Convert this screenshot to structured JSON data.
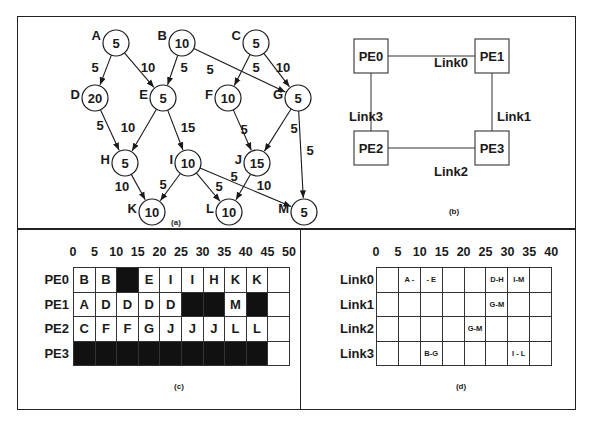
{
  "panels": {
    "a": {
      "caption": "(a)",
      "nodes": [
        {
          "id": "A",
          "weight": "5",
          "x": 116,
          "y": 43
        },
        {
          "id": "B",
          "weight": "10",
          "x": 182,
          "y": 43
        },
        {
          "id": "C",
          "weight": "5",
          "x": 256,
          "y": 43
        },
        {
          "id": "D",
          "weight": "20",
          "x": 95,
          "y": 98
        },
        {
          "id": "E",
          "weight": "5",
          "x": 163,
          "y": 98
        },
        {
          "id": "F",
          "weight": "10",
          "x": 228,
          "y": 98
        },
        {
          "id": "G",
          "weight": "5",
          "x": 298,
          "y": 98
        },
        {
          "id": "H",
          "weight": "5",
          "x": 125,
          "y": 163
        },
        {
          "id": "I",
          "weight": "10",
          "x": 188,
          "y": 163
        },
        {
          "id": "J",
          "weight": "15",
          "x": 257,
          "y": 163
        },
        {
          "id": "K",
          "weight": "10",
          "x": 152,
          "y": 212
        },
        {
          "id": "L",
          "weight": "10",
          "x": 229,
          "y": 212
        },
        {
          "id": "M",
          "weight": "5",
          "x": 304,
          "y": 212
        }
      ],
      "edges": [
        {
          "from": "A",
          "to": "D",
          "weight": "5",
          "lx": 95,
          "ly": 72
        },
        {
          "from": "A",
          "to": "E",
          "weight": "10",
          "lx": 148,
          "ly": 72
        },
        {
          "from": "B",
          "to": "E",
          "weight": "5",
          "lx": 184,
          "ly": 72
        },
        {
          "from": "B",
          "to": "G",
          "weight": "5",
          "lx": 210,
          "ly": 74
        },
        {
          "from": "C",
          "to": "F",
          "weight": "5",
          "lx": 256,
          "ly": 72
        },
        {
          "from": "C",
          "to": "G",
          "weight": "10",
          "lx": 283,
          "ly": 72
        },
        {
          "from": "D",
          "to": "H",
          "weight": "5",
          "lx": 100,
          "ly": 130
        },
        {
          "from": "E",
          "to": "H",
          "weight": "10",
          "lx": 128,
          "ly": 132
        },
        {
          "from": "E",
          "to": "I",
          "weight": "15",
          "lx": 188,
          "ly": 132
        },
        {
          "from": "F",
          "to": "J",
          "weight": "5",
          "lx": 244,
          "ly": 134
        },
        {
          "from": "G",
          "to": "J",
          "weight": "5",
          "lx": 294,
          "ly": 133
        },
        {
          "from": "G",
          "to": "M",
          "weight": "5",
          "lx": 310,
          "ly": 155
        },
        {
          "from": "H",
          "to": "K",
          "weight": "10",
          "lx": 122,
          "ly": 191
        },
        {
          "from": "I",
          "to": "K",
          "weight": "5",
          "lx": 163,
          "ly": 189
        },
        {
          "from": "I",
          "to": "L",
          "weight": "5",
          "lx": 219,
          "ly": 191
        },
        {
          "from": "I",
          "to": "M",
          "weight": "10",
          "lx": 264,
          "ly": 190
        },
        {
          "from": "J",
          "to": "L",
          "weight": "5",
          "lx": 234,
          "ly": 181
        }
      ]
    },
    "b": {
      "caption": "(b)",
      "pes": [
        {
          "id": "PE0",
          "x": 371,
          "y": 56
        },
        {
          "id": "PE1",
          "x": 492,
          "y": 56
        },
        {
          "id": "PE2",
          "x": 371,
          "y": 148
        },
        {
          "id": "PE3",
          "x": 492,
          "y": 148
        }
      ],
      "links": [
        {
          "label": "Link0",
          "lx": 451,
          "ly": 67
        },
        {
          "label": "Link1",
          "lx": 514,
          "ly": 121
        },
        {
          "label": "Link2",
          "lx": 451,
          "ly": 176
        },
        {
          "label": "Link3",
          "lx": 366,
          "ly": 121
        }
      ]
    },
    "c": {
      "caption": "(c)",
      "ticks": [
        "0",
        "5",
        "10",
        "15",
        "20",
        "25",
        "30",
        "35",
        "40",
        "45",
        "50"
      ],
      "rows": [
        {
          "label": "PE0",
          "cells": [
            "B",
            "B",
            "#",
            "E",
            "I",
            "I",
            "H",
            "K",
            "K",
            ""
          ]
        },
        {
          "label": "PE1",
          "cells": [
            "A",
            "D",
            "D",
            "D",
            "D",
            "#",
            "#",
            "M",
            "#",
            ""
          ]
        },
        {
          "label": "PE2",
          "cells": [
            "C",
            "F",
            "F",
            "G",
            "J",
            "J",
            "J",
            "L",
            "L",
            ""
          ]
        },
        {
          "label": "PE3",
          "cells": [
            "#",
            "#",
            "#",
            "#",
            "#",
            "#",
            "#",
            "#",
            "#",
            ""
          ]
        }
      ]
    },
    "d": {
      "caption": "(d)",
      "ticks": [
        "0",
        "5",
        "10",
        "15",
        "20",
        "25",
        "30",
        "35",
        "40"
      ],
      "rows": [
        {
          "label": "Link0",
          "cells": [
            "",
            "A -",
            "- E",
            "",
            "",
            "D-H",
            "I-M",
            ""
          ]
        },
        {
          "label": "Link1",
          "cells": [
            "",
            "",
            "",
            "",
            "",
            "G-M",
            "",
            ""
          ]
        },
        {
          "label": "Link2",
          "cells": [
            "",
            "",
            "",
            "",
            "G-M",
            "",
            "",
            ""
          ]
        },
        {
          "label": "Link3",
          "cells": [
            "",
            "",
            "B-G",
            "",
            "",
            "",
            "I - L",
            ""
          ]
        }
      ]
    }
  },
  "colors": {
    "ink": "#1a1a1a",
    "busy": "#111111",
    "paper": "#ffffff"
  }
}
